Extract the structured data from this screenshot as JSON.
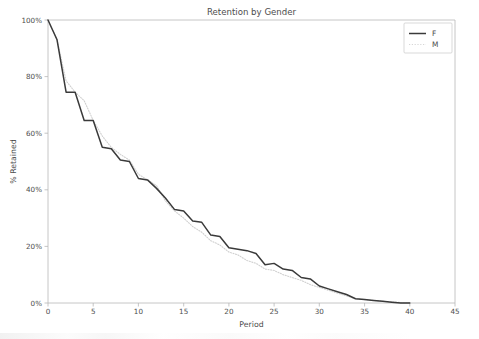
{
  "chart_data": {
    "type": "line",
    "title": "Retention by Gender",
    "xlabel": "Period",
    "ylabel": "% Retained",
    "xlim": [
      0,
      45
    ],
    "ylim": [
      0,
      100
    ],
    "xticks": [
      0,
      5,
      10,
      15,
      20,
      25,
      30,
      35,
      40,
      45
    ],
    "xtick_labels": [
      "0",
      "5",
      "10",
      "15",
      "20",
      "25",
      "30",
      "35",
      "40",
      "45"
    ],
    "yticks": [
      0,
      20,
      40,
      60,
      80,
      100
    ],
    "ytick_labels": [
      "0%",
      "20%",
      "40%",
      "60%",
      "80%",
      "100%"
    ],
    "grid": false,
    "legend_position": "upper right",
    "legend_entries": [
      "F",
      "M"
    ],
    "x": [
      0,
      1,
      2,
      3,
      4,
      5,
      6,
      7,
      8,
      9,
      10,
      11,
      12,
      13,
      14,
      15,
      16,
      17,
      18,
      19,
      20,
      21,
      22,
      23,
      24,
      25,
      26,
      27,
      28,
      29,
      30,
      31,
      32,
      33,
      34,
      35,
      36,
      37,
      38,
      39,
      40
    ],
    "series": [
      {
        "name": "F",
        "style": "solid",
        "color": "#3a3a3a",
        "values": [
          100,
          93.0,
          74.5,
          74.5,
          64.5,
          64.5,
          55.0,
          54.5,
          50.5,
          50.0,
          44.0,
          43.5,
          40.5,
          37.0,
          33.0,
          32.5,
          29.0,
          28.5,
          24.0,
          23.5,
          19.5,
          19.0,
          18.5,
          17.5,
          13.5,
          14.0,
          12.0,
          11.5,
          9.0,
          8.5,
          6.0,
          5.0,
          4.0,
          3.0,
          1.5,
          1.2,
          0.9,
          0.6,
          0.3,
          0.0,
          0.0
        ]
      },
      {
        "name": "M",
        "style": "dotted",
        "color": "#d0d0d0",
        "values": [
          100,
          93.0,
          78.5,
          74.5,
          71.5,
          64.5,
          59.0,
          55.0,
          52.5,
          50.5,
          45.5,
          43.5,
          41.5,
          36.0,
          32.5,
          30.0,
          27.0,
          25.0,
          22.0,
          20.5,
          18.0,
          17.0,
          15.0,
          14.0,
          12.0,
          11.5,
          10.0,
          9.0,
          8.0,
          6.5,
          5.5,
          4.5,
          3.5,
          2.5,
          1.5,
          1.2,
          0.9,
          0.6,
          0.4,
          0.2,
          0.2
        ]
      }
    ]
  },
  "legend": {
    "items": [
      {
        "label": "F"
      },
      {
        "label": "M"
      }
    ]
  }
}
